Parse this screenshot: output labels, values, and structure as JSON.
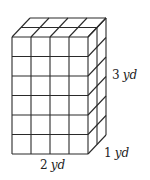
{
  "figure": {
    "grid": {
      "width_units": 4,
      "height_units": 6,
      "depth_units": 2
    },
    "stroke_color": "#2a2a2a",
    "background": "#ffffff"
  },
  "labels": {
    "height": {
      "value": "3",
      "unit": "yd"
    },
    "depth": {
      "value": "1",
      "unit": "yd"
    },
    "width": {
      "value": "2",
      "unit": "yd"
    }
  }
}
